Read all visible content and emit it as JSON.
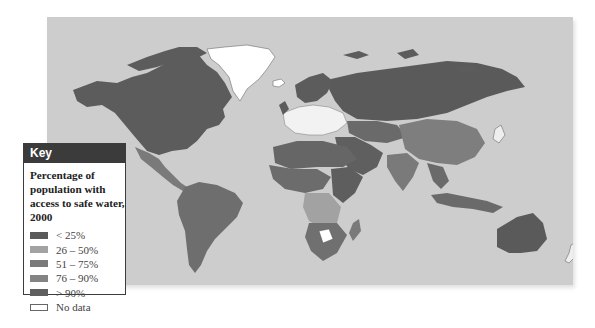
{
  "map": {
    "title": "Percentage of population with access to safe water, 2000",
    "ocean_color": "#cdcdcd"
  },
  "key": {
    "header": "Key",
    "title": "Percentage of population with access to safe water, 2000",
    "items": [
      {
        "label": "< 25%",
        "color": "#5a5a5a"
      },
      {
        "label": "26 – 50%",
        "color": "#a3a3a3"
      },
      {
        "label": "51 – 75%",
        "color": "#7a7a7a"
      },
      {
        "label": "76 – 90%",
        "color": "#848484"
      },
      {
        "label": "> 90%",
        "color": "#5f5f5f"
      },
      {
        "label": "No data",
        "color": "#ffffff"
      }
    ]
  },
  "regions": {
    "north_america": "> 90%",
    "greenland": "No data",
    "south_america": "76 – 90%",
    "europe": "No data / > 90%",
    "russia": "> 90%",
    "china": "76 – 90%",
    "africa": "mixed",
    "australia": "> 90%",
    "new_zealand": "No data"
  }
}
